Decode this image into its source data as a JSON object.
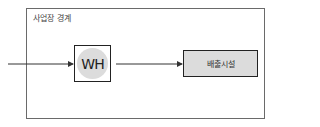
{
  "diagram": {
    "boundary_label": "사업장 경계",
    "nodes": [
      {
        "id": "wh",
        "label": "WH",
        "shape": "square-with-circle"
      },
      {
        "id": "emission",
        "label": "배출시설",
        "shape": "shaded-rectangle"
      }
    ],
    "edges": [
      {
        "from": "external",
        "to": "wh"
      },
      {
        "from": "wh",
        "to": "emission"
      }
    ],
    "colors": {
      "border": "#222222",
      "fill": "#dcdcdc",
      "boundary": "#6a6a6a"
    }
  }
}
